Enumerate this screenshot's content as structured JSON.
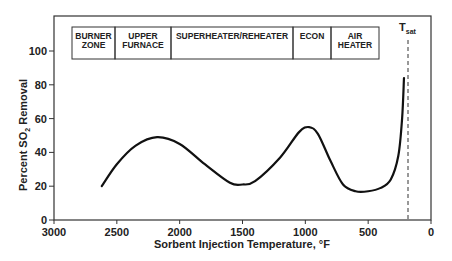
{
  "chart_data": {
    "type": "line",
    "title": "",
    "xlabel": "Sorbent Injection Temperature, °F",
    "ylabel_parts": {
      "pre": "Percent SO",
      "sub": "2",
      "post": " Removal"
    },
    "ylabel": "Percent SO2 Removal",
    "xlim": [
      3000,
      0
    ],
    "ylim": [
      0,
      100
    ],
    "x_ticks": [
      3000,
      2500,
      2000,
      1500,
      1000,
      500,
      0
    ],
    "y_ticks": [
      0,
      20,
      40,
      60,
      80,
      100
    ],
    "grid": false,
    "series": [
      {
        "name": "SO2 removal",
        "x": [
          2620,
          2500,
          2350,
          2180,
          2000,
          1800,
          1600,
          1500,
          1400,
          1200,
          1050,
          970,
          900,
          800,
          700,
          600,
          500,
          400,
          320,
          260,
          230,
          215
        ],
        "y": [
          20,
          33,
          44,
          49,
          45,
          33,
          22,
          21,
          23,
          37,
          52,
          55,
          51,
          35,
          21,
          17,
          17,
          19,
          24,
          38,
          60,
          84
        ]
      }
    ],
    "annotations": {
      "tsat": {
        "label_main": "T",
        "label_sub": "sat",
        "x": 183,
        "style": "dashed"
      },
      "zones": [
        {
          "line1": "BURNER",
          "line2": "ZONE"
        },
        {
          "line1": "UPPER",
          "line2": "FURNACE"
        },
        {
          "line1": "SUPERHEATER/REHEATER",
          "line2": ""
        },
        {
          "line1": "ECON",
          "line2": ""
        },
        {
          "line1": "AIR",
          "line2": "HEATER"
        }
      ]
    }
  }
}
